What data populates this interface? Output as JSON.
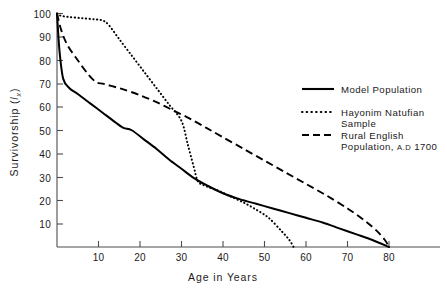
{
  "chart_data": {
    "type": "line",
    "title": "",
    "xlabel": "Age in Years",
    "ylabel": "Survivorship (lx)",
    "ylabel_main": "Survivorship  (",
    "ylabel_italic": "l",
    "ylabel_sub": "x",
    "ylabel_close": ")",
    "xlim": [
      0,
      82
    ],
    "ylim": [
      0,
      103
    ],
    "grid": false,
    "legend_position": "right",
    "xticks": [
      0,
      10,
      20,
      30,
      40,
      50,
      60,
      70,
      80
    ],
    "xtick_labels": [
      "",
      "10",
      "20",
      "30",
      "40",
      "50",
      "60",
      "70",
      "80"
    ],
    "yticks": [
      10,
      20,
      30,
      40,
      50,
      60,
      70,
      80,
      90,
      100
    ],
    "ytick_labels": [
      "10",
      "20",
      "30",
      "40",
      "50",
      "60",
      "70",
      "80",
      "90",
      "100"
    ],
    "series": [
      {
        "name": "Model Population",
        "style": "solid",
        "color": "#000000",
        "x": [
          0,
          0.6,
          1.5,
          3,
          5,
          8,
          11,
          14,
          16,
          18,
          21,
          24,
          27,
          30,
          33,
          36,
          40,
          44,
          48,
          52,
          56,
          60,
          64,
          68,
          72,
          76,
          80
        ],
        "y": [
          100,
          84,
          72,
          68,
          65.5,
          61.5,
          57.5,
          53.5,
          51,
          50,
          46,
          42,
          37.5,
          33.5,
          29.5,
          26.5,
          23,
          20.5,
          18.5,
          16.5,
          14.5,
          12.5,
          10.5,
          8,
          5.5,
          3,
          0
        ]
      },
      {
        "name": "Hayonim Natufian Sample",
        "style": "dotted",
        "color": "#000000",
        "x": [
          0,
          1,
          3,
          6,
          9,
          11,
          12.5,
          15,
          18,
          21,
          24,
          27,
          30,
          31.5,
          33,
          34,
          36,
          39,
          42,
          45,
          48,
          51,
          54,
          56,
          57
        ],
        "y": [
          100,
          99,
          98.5,
          98,
          97.5,
          97,
          95,
          89,
          82,
          75,
          68,
          61,
          54,
          44,
          34,
          28,
          26,
          24,
          21.5,
          19,
          16,
          12.5,
          7,
          3,
          0
        ]
      },
      {
        "name": "Rural English Population, A.D 1700",
        "style": "dashed",
        "color": "#000000",
        "x": [
          0,
          1,
          2.5,
          5,
          7.5,
          9.5,
          11,
          13,
          16,
          20,
          24,
          28,
          32,
          36,
          40,
          45,
          50,
          55,
          60,
          65,
          70,
          74,
          77,
          79,
          80
        ],
        "y": [
          100,
          93,
          86.5,
          80,
          74,
          70.5,
          70,
          69,
          67.5,
          65,
          62,
          58.5,
          55,
          51,
          47,
          42,
          37,
          32,
          27,
          22,
          16.5,
          11.5,
          7,
          3,
          0
        ]
      }
    ],
    "legend_entries": [
      {
        "label": "Model Population",
        "label_line2": "",
        "style": "solid"
      },
      {
        "label": "Hayonim Natufian",
        "label_line2": "Sample",
        "style": "dotted"
      },
      {
        "label": "Rural English",
        "label_line2": "Population, A.D 1700",
        "style": "dashed"
      }
    ]
  },
  "legend": {
    "entry1_line1": "Model Population",
    "entry2_line1": "Hayonim Natufian",
    "entry2_line2": "Sample",
    "entry3_line1": "Rural English",
    "entry3_line2_prefix": "Population, ",
    "entry3_line2_ad": "A.D",
    "entry3_line2_year": " 1700"
  },
  "axes": {
    "x_title": "Age in Years",
    "y_title_prefix": "Survivorship  (",
    "y_title_italic": "l",
    "y_title_sub": "x",
    "y_title_suffix": ")",
    "x_tick_10": "10",
    "x_tick_20": "20",
    "x_tick_30": "30",
    "x_tick_40": "40",
    "x_tick_50": "50",
    "x_tick_60": "60",
    "x_tick_70": "70",
    "x_tick_80": "80",
    "y_tick_10": "10",
    "y_tick_20": "20",
    "y_tick_30": "30",
    "y_tick_40": "40",
    "y_tick_50": "50",
    "y_tick_60": "60",
    "y_tick_70": "70",
    "y_tick_80": "80",
    "y_tick_90": "90",
    "y_tick_100": "100"
  }
}
